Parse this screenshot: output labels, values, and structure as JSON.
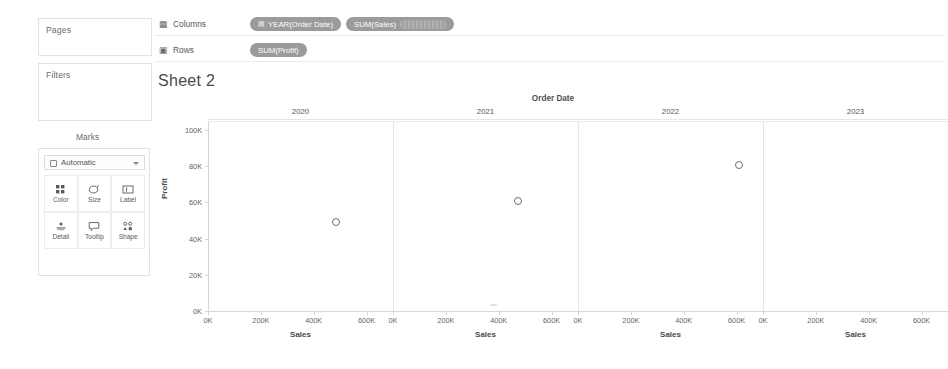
{
  "left_panel": {
    "pages_label": "Pages",
    "filters_label": "Filters",
    "marks_label": "Marks",
    "mark_type": {
      "value": "Automatic",
      "icon": "mark-type-icon",
      "caret": "chevron-down-icon"
    },
    "mark_buttons": [
      {
        "label": "Color",
        "icon": "color-icon"
      },
      {
        "label": "Size",
        "icon": "size-icon"
      },
      {
        "label": "Label",
        "icon": "label-icon"
      },
      {
        "label": "Detail",
        "icon": "detail-icon"
      },
      {
        "label": "Tooltip",
        "icon": "tooltip-icon"
      },
      {
        "label": "Shape",
        "icon": "shape-icon"
      }
    ]
  },
  "shelves": {
    "columns": {
      "name": "Columns",
      "icon": "columns-icon",
      "pills": [
        {
          "label": "YEAR(Order Date)",
          "icon": "calendar-icon",
          "redacted": false
        },
        {
          "label": "SUM(Sales)",
          "icon": "",
          "redacted": true
        }
      ]
    },
    "rows": {
      "name": "Rows",
      "icon": "rows-icon",
      "pills": [
        {
          "label": "SUM(Profit)",
          "icon": "",
          "redacted": true
        }
      ]
    }
  },
  "sheet": {
    "title": "Sheet 2"
  },
  "chart_data": {
    "type": "scatter",
    "title": "Sheet 2",
    "top_field_label": "Order Date",
    "panel_field": "Order Date",
    "categories": [
      "2020",
      "2021",
      "2022",
      "2023"
    ],
    "xlabel": "Sales",
    "ylabel": "Profit",
    "xlim": [
      0,
      700000
    ],
    "ylim": [
      0,
      105000
    ],
    "xticks": [
      "0K",
      "200K",
      "400K",
      "600K"
    ],
    "xtick_values": [
      0,
      200000,
      400000,
      600000
    ],
    "yticks": [
      "100K",
      "80K",
      "60K",
      "40K",
      "20K",
      "0K"
    ],
    "ytick_values": [
      100000,
      80000,
      60000,
      40000,
      20000,
      0
    ],
    "grid": false,
    "legend": "none",
    "mark_shape": "hollow-circle",
    "mark_color": "#6f6f6f",
    "series": [
      {
        "name": "SUM(Sales) vs SUM(Profit)",
        "points": [
          {
            "panel": "2020",
            "x": 484000,
            "y": 49500
          },
          {
            "panel": "2021",
            "x": 470000,
            "y": 61500
          },
          {
            "panel": "2022",
            "x": 609000,
            "y": 81500
          },
          {
            "panel": "2023",
            "x": 733000,
            "y": 93500
          }
        ]
      }
    ]
  }
}
